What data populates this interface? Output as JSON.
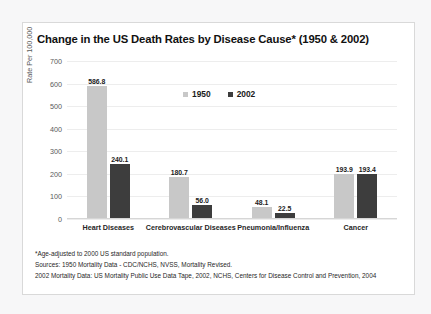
{
  "card": {
    "title": "Change in the US Death Rates by Disease Cause* (1950 & 2002)"
  },
  "footnotes": [
    "*Age-adjusted to 2000 US standard population.",
    "Sources: 1950 Mortality Data - CDC/NCHS, NVSS, Mortality Revised.",
    "2002 Mortality Data: US Mortality Public Use Data Tape, 2002, NCHS, Centers for Disease Control and Prevention, 2004"
  ],
  "colors": {
    "series_1950": "#c8c8c8",
    "series_2002": "#3d3d3d",
    "gridline": "#ededed",
    "card_background": "#ffffff",
    "page_background": "#f7f7f8"
  },
  "chart_data": {
    "type": "bar",
    "title": "Change in the US Death Rates by Disease Cause* (1950 & 2002)",
    "xlabel": "",
    "ylabel": "Rate Per 100,000",
    "ylim": [
      0,
      700
    ],
    "ytick_step": 100,
    "yticks": [
      "700",
      "600",
      "500",
      "400",
      "300",
      "200",
      "100",
      "0"
    ],
    "grid": true,
    "legend_position": "top-center",
    "categories": [
      "Heart Diseases",
      "Cerebrovascular Diseases",
      "Pneumonia/Influenza",
      "Cancer"
    ],
    "series": [
      {
        "name": "1950",
        "color": "#c8c8c8",
        "values": [
          586.8,
          180.7,
          48.1,
          193.9
        ]
      },
      {
        "name": "2002",
        "color": "#3d3d3d",
        "values": [
          240.1,
          56.0,
          22.5,
          193.4
        ]
      }
    ],
    "data_labels": [
      [
        "586.8",
        "240.1"
      ],
      [
        "180.7",
        "56.0"
      ],
      [
        "48.1",
        "22.5"
      ],
      [
        "193.9",
        "193.4"
      ]
    ]
  }
}
